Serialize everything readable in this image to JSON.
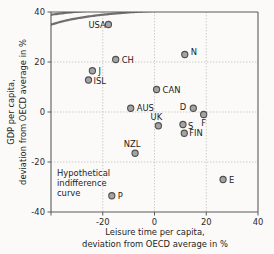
{
  "chart_data": {
    "type": "scatter",
    "title": "",
    "xlabel": "Leisure time per capita, deviation from OECD average in %",
    "xlabel_line1": "Leisure time per capita,",
    "xlabel_line2": "deviation from OECD average in %",
    "ylabel": "GDP per capita, deviation from OECD average in %",
    "ylabel_line1": "GDP per capita,",
    "ylabel_line2": "deviation from OECD average in %",
    "xlim": [
      -40,
      40
    ],
    "ylim": [
      -40,
      40
    ],
    "xticks": [
      -40,
      -20,
      0,
      20,
      40
    ],
    "xticklabels": [
      "",
      "-20",
      "0",
      "20",
      "40"
    ],
    "yticks": [
      -40,
      -20,
      0,
      20,
      40
    ],
    "yticklabels": [
      "-40",
      "-20",
      "0",
      "20",
      "40"
    ],
    "grid": true,
    "legend": "none",
    "marker_color": "#a3a3a3",
    "marker_edge_color": "#4f4f4f",
    "curve_color": "#6e6e6e",
    "grid_color": "#b9b4ae",
    "axis_color": "#5a5a5a",
    "background_color": "#fbfaf8",
    "points": [
      {
        "label": "USA",
        "x": -17.8,
        "y": 35.0,
        "label_dx": -20,
        "label_dy": 3,
        "anchor": "start"
      },
      {
        "label": "CH",
        "x": -15.0,
        "y": 21.0,
        "label_dx": 6,
        "label_dy": 3,
        "anchor": "start"
      },
      {
        "label": "J",
        "x": -24.0,
        "y": 16.5,
        "label_dx": 6,
        "label_dy": 3,
        "anchor": "start"
      },
      {
        "label": "ISL",
        "x": -25.5,
        "y": 12.8,
        "label_dx": 5,
        "label_dy": 3.5,
        "anchor": "start"
      },
      {
        "label": "N",
        "x": 11.7,
        "y": 23.0,
        "label_dx": 6,
        "label_dy": 0,
        "anchor": "start"
      },
      {
        "label": "CAN",
        "x": 0.8,
        "y": 9.0,
        "label_dx": 6,
        "label_dy": 3,
        "anchor": "start"
      },
      {
        "label": "AUS",
        "x": -9.2,
        "y": 1.5,
        "label_dx": 6,
        "label_dy": 3,
        "anchor": "start"
      },
      {
        "label": "D",
        "x": 15.0,
        "y": 1.5,
        "label_dx": -7,
        "label_dy": 2,
        "anchor": "end"
      },
      {
        "label": "F",
        "x": 19.0,
        "y": -1.0,
        "label_dx": 0,
        "label_dy": 11,
        "anchor": "middle"
      },
      {
        "label": "UK",
        "x": 1.5,
        "y": -5.5,
        "label_dx": -2,
        "label_dy": -6,
        "anchor": "middle"
      },
      {
        "label": "S",
        "x": 11.0,
        "y": -5.0,
        "label_dx": 5,
        "label_dy": 4,
        "anchor": "start"
      },
      {
        "label": "FIN",
        "x": 11.5,
        "y": -8.5,
        "label_dx": 5,
        "label_dy": 3,
        "anchor": "start"
      },
      {
        "label": "NZL",
        "x": -7.5,
        "y": -16.5,
        "label_dx": -3,
        "label_dy": -6,
        "anchor": "middle"
      },
      {
        "label": "E",
        "x": 26.5,
        "y": -27.0,
        "label_dx": 6,
        "label_dy": 3,
        "anchor": "start"
      },
      {
        "label": "P",
        "x": -16.5,
        "y": -33.5,
        "label_dx": 6,
        "label_dy": 3,
        "anchor": "start"
      }
    ],
    "annotation": {
      "lines": [
        "Hypothetical",
        "indifference",
        "curve"
      ],
      "x": -35.0,
      "y": -23.0
    },
    "curves": [
      {
        "name": "indifference-curve-1",
        "k": 280,
        "shift": 62
      },
      {
        "name": "indifference-curve-2",
        "k": 620,
        "shift": 40
      },
      {
        "name": "indifference-curve-3",
        "k": 1050,
        "shift": 22
      },
      {
        "name": "indifference-curve-4",
        "k": 1500,
        "shift": 6
      }
    ]
  }
}
